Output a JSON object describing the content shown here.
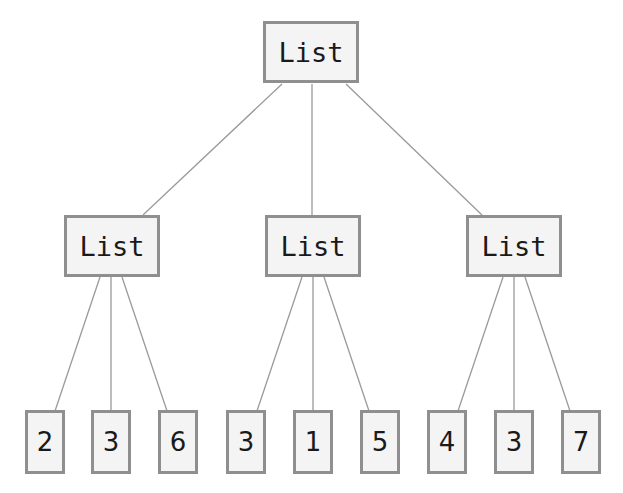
{
  "diagram": {
    "type": "tree",
    "colors": {
      "node_border": "#8f8f8f",
      "node_fill": "#f4f4f4",
      "edge": "#9a9a9a",
      "text": "#1a1a1a"
    },
    "root": {
      "label": "List"
    },
    "children": [
      {
        "label": "List",
        "leaves": [
          "2",
          "3",
          "6"
        ]
      },
      {
        "label": "List",
        "leaves": [
          "3",
          "1",
          "5"
        ]
      },
      {
        "label": "List",
        "leaves": [
          "4",
          "3",
          "7"
        ]
      }
    ]
  }
}
